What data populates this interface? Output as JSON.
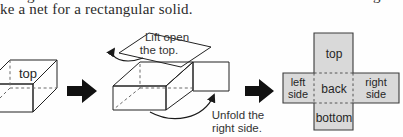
{
  "caption": {
    "visible_line": "ke a net for a rectangular solid.",
    "clipped_fragment_left": "g",
    "clipped_fragment_right": "g"
  },
  "step1_solid": {
    "top_face_label": "top"
  },
  "step2_open_box": {
    "lift_annotation": {
      "line1": "Lift open",
      "line2": "the top."
    },
    "unfold_annotation": {
      "line1": "Unfold the",
      "line2": "right side."
    }
  },
  "step3_net": {
    "top": "top",
    "back": "back",
    "bottom": "bottom",
    "left_side_line1": "left",
    "left_side_line2": "side",
    "right_side_line1": "right",
    "right_side_line2": "side"
  },
  "colors": {
    "paper": "#fefefe",
    "ink": "#2b2b2b",
    "box_top_face": "#e4e4e4",
    "box_front_face": "#c6c6c6",
    "box_right_face": "#9c9c9c",
    "open_box_right_face": "#949494",
    "box_interior": "#1d1d1d",
    "lid": "#e0e0e0",
    "unfolded_side": "#ffffff",
    "net_fill": "#d9d9d9",
    "step_arrow": "#111111"
  }
}
